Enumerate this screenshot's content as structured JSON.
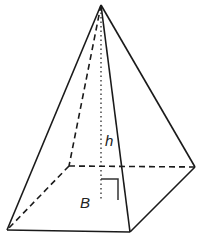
{
  "diagram": {
    "type": "square-pyramid",
    "labels": {
      "height": "h",
      "base": "B"
    },
    "colors": {
      "stroke": "#1a1a1a",
      "background": "#ffffff"
    },
    "vertices": {
      "apex": [
        101,
        5
      ],
      "base_front_left": [
        7,
        230
      ],
      "base_front_right": [
        130,
        232
      ],
      "base_back_right": [
        195,
        167
      ],
      "base_back_left": [
        69,
        166
      ],
      "height_foot": [
        101,
        199
      ]
    }
  }
}
